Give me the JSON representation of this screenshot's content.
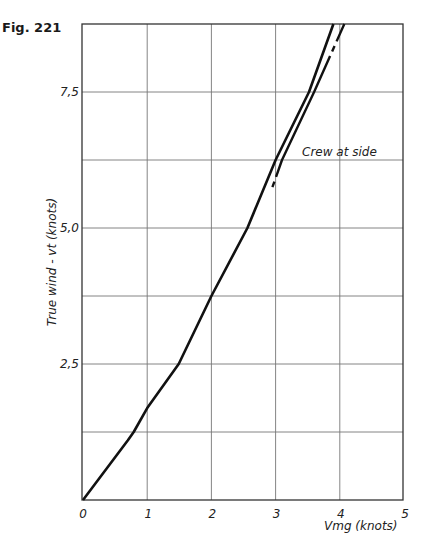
{
  "figure_label": "Fig. 221",
  "chart_data": {
    "type": "line",
    "title": "",
    "xlabel": "Vmg (knots)",
    "ylabel": "True wind - vt (knots)",
    "xlim": [
      0,
      5
    ],
    "ylim": [
      0,
      8.75
    ],
    "grid": true,
    "x_ticks": [
      0,
      1,
      2,
      3,
      4,
      5
    ],
    "x_tick_labels": [
      "0",
      "1",
      "2",
      "3",
      "4",
      "5"
    ],
    "y_ticks": [
      2.5,
      5.0,
      7.5
    ],
    "y_tick_labels": [
      "2,5",
      "5,0",
      "7,5"
    ],
    "y_gridlines": [
      1.25,
      2.5,
      3.75,
      5.0,
      6.25,
      7.5
    ],
    "legend": null,
    "series": [
      {
        "name": "Main curve",
        "style": "solid",
        "x": [
          0,
          0.7,
          0.79,
          1.0,
          1.49,
          2.0,
          2.56,
          3.0,
          3.52,
          3.9
        ],
        "y": [
          0,
          1.1,
          1.25,
          1.69,
          2.5,
          3.75,
          5.0,
          6.25,
          7.5,
          8.75
        ]
      },
      {
        "name": "Crew at side",
        "style": "broken-solid",
        "x": [
          2.95,
          3.1,
          3.6,
          4.07
        ],
        "y": [
          5.75,
          6.25,
          7.5,
          8.75
        ]
      }
    ],
    "annotations": [
      {
        "text": "Crew at side",
        "x": 3.4,
        "y": 6.35
      }
    ]
  }
}
